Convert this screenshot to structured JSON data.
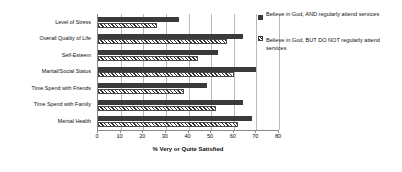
{
  "chart_data": {
    "type": "bar",
    "orientation": "horizontal",
    "title": "",
    "xlabel": "% Very or Quite Satisfied",
    "ylabel": "",
    "xlim": [
      0,
      80
    ],
    "xticks": [
      0,
      10,
      20,
      30,
      40,
      50,
      60,
      70,
      80
    ],
    "grid": true,
    "grid_axis": "x",
    "legend_position": "right",
    "categories": [
      "Level of Stress",
      "Overall Quality of Life",
      "Self-Esteem",
      "Marital/Social Status",
      "Time Spend with Friends",
      "Time Spend with Family",
      "Mental Health"
    ],
    "series": [
      {
        "name": "Believe in God, AND regularly attend services",
        "style": "solid",
        "color": "#3a3a3a",
        "values": [
          36,
          64,
          53,
          70,
          48,
          64,
          68
        ]
      },
      {
        "name": "Believe in God, BUT DO NOT regularly attend services",
        "style": "hatched",
        "color": "#2f2f2f",
        "values": [
          26,
          57,
          44,
          60,
          38,
          52,
          62
        ]
      }
    ]
  },
  "axis": {
    "x_title": "% Very or Quite Satisfied",
    "tick_labels": [
      "0",
      "10",
      "20",
      "30",
      "40",
      "50",
      "60",
      "70",
      "80"
    ]
  },
  "legend": {
    "entries": [
      {
        "label": "Believe in God, AND regularly attend services"
      },
      {
        "label": "Believe in God, BUT DO NOT regularly attend services"
      }
    ]
  }
}
